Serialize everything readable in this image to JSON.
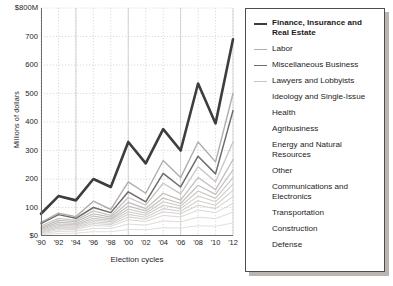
{
  "axes": {
    "ylabel": "Millions of dollars",
    "xlabel": "Election cycles",
    "yticks": [
      "$800M",
      "700",
      "600",
      "500",
      "400",
      "300",
      "200",
      "100",
      "$0"
    ],
    "xticks": [
      "'90",
      "'92",
      "'94",
      "'96",
      "'98",
      "'00",
      "'02",
      "'04",
      "'06",
      "'08",
      "'10",
      "'12"
    ]
  },
  "legend": {
    "items": [
      {
        "label": "Finance, Insurance and Real Estate",
        "color": "#3f3c3c",
        "width": 2.6,
        "bold": true,
        "swatch": true
      },
      {
        "label": "Labor",
        "color": "#b0adab",
        "width": 1.4,
        "bold": false,
        "swatch": true
      },
      {
        "label": "Miscellaneous Business",
        "color": "#6e6b6a",
        "width": 1.5,
        "bold": false,
        "swatch": true
      },
      {
        "label": "Lawyers and Lobbyists",
        "color": "#c8c5c3",
        "width": 1.3,
        "bold": false,
        "swatch": true
      },
      {
        "label": "Ideology and Single-Issue",
        "color": "#bfbcba",
        "width": 1.2,
        "bold": false,
        "swatch": false
      },
      {
        "label": "Health",
        "color": "#c4c1bf",
        "width": 1.2,
        "bold": false,
        "swatch": false
      },
      {
        "label": "Agribusiness",
        "color": "#cac7c5",
        "width": 1.1,
        "bold": false,
        "swatch": false
      },
      {
        "label": "Energy and Natural Resources",
        "color": "#cfccca",
        "width": 1.1,
        "bold": false,
        "swatch": false
      },
      {
        "label": "Other",
        "color": "#d3d0ce",
        "width": 1.1,
        "bold": false,
        "swatch": false
      },
      {
        "label": "Communications and Electronics",
        "color": "#d6d3d1",
        "width": 1.1,
        "bold": false,
        "swatch": false
      },
      {
        "label": "Transportation",
        "color": "#dad7d5",
        "width": 1.0,
        "bold": false,
        "swatch": false
      },
      {
        "label": "Construction",
        "color": "#dedbd9",
        "width": 1.0,
        "bold": false,
        "swatch": false
      },
      {
        "label": "Defense",
        "color": "#e2dfdd",
        "width": 1.0,
        "bold": false,
        "swatch": false
      }
    ]
  },
  "chart_data": {
    "type": "line",
    "title": "",
    "xlabel": "Election cycles",
    "ylabel": "Millions of dollars",
    "x": [
      "'90",
      "'92",
      "'94",
      "'96",
      "'98",
      "'00",
      "'02",
      "'04",
      "'06",
      "'08",
      "'10",
      "'12"
    ],
    "ylim": [
      0,
      800
    ],
    "xlim": [
      "'90",
      "'12"
    ],
    "yticks": [
      0,
      100,
      200,
      300,
      400,
      500,
      600,
      700,
      800
    ],
    "grid": true,
    "legend_position": "right",
    "series": [
      {
        "name": "Finance, Insurance and Real Estate",
        "color": "#3f3c3c",
        "width": 2.6,
        "values": [
          78,
          140,
          125,
          200,
          172,
          330,
          255,
          375,
          300,
          535,
          395,
          690
        ]
      },
      {
        "name": "Labor",
        "color": "#b0adab",
        "width": 1.4,
        "values": [
          48,
          80,
          68,
          122,
          93,
          190,
          150,
          265,
          205,
          330,
          260,
          500
        ]
      },
      {
        "name": "Miscellaneous Business",
        "color": "#6e6b6a",
        "width": 1.5,
        "values": [
          44,
          75,
          62,
          100,
          82,
          155,
          120,
          220,
          172,
          280,
          218,
          440
        ]
      },
      {
        "name": "Lawyers and Lobbyists",
        "color": "#c8c5c3",
        "width": 1.3,
        "values": [
          35,
          62,
          55,
          88,
          72,
          135,
          108,
          185,
          148,
          243,
          190,
          330
        ]
      },
      {
        "name": "Ideology and Single-Issue",
        "color": "#bfbcba",
        "width": 1.2,
        "values": [
          30,
          55,
          50,
          78,
          66,
          118,
          96,
          150,
          126,
          205,
          162,
          268
        ]
      },
      {
        "name": "Health",
        "color": "#c4c1bf",
        "width": 1.2,
        "values": [
          26,
          48,
          44,
          70,
          60,
          105,
          88,
          133,
          114,
          178,
          146,
          232
        ]
      },
      {
        "name": "Agribusiness",
        "color": "#cac7c5",
        "width": 1.1,
        "values": [
          22,
          42,
          39,
          62,
          55,
          95,
          80,
          120,
          105,
          158,
          132,
          205
        ]
      },
      {
        "name": "Energy and Natural Resources",
        "color": "#cfccca",
        "width": 1.1,
        "values": [
          19,
          37,
          35,
          56,
          50,
          85,
          73,
          108,
          96,
          140,
          120,
          182
        ]
      },
      {
        "name": "Other",
        "color": "#d3d0ce",
        "width": 1.1,
        "values": [
          16,
          32,
          31,
          50,
          45,
          76,
          66,
          96,
          87,
          124,
          108,
          160
        ]
      },
      {
        "name": "Communications and Electronics",
        "color": "#d6d3d1",
        "width": 1.1,
        "values": [
          13,
          27,
          27,
          44,
          40,
          67,
          59,
          85,
          78,
          108,
          96,
          138
        ]
      },
      {
        "name": "Transportation",
        "color": "#dad7d5",
        "width": 1.0,
        "values": [
          11,
          22,
          23,
          37,
          34,
          57,
          51,
          72,
          67,
          91,
          82,
          114
        ]
      },
      {
        "name": "Construction",
        "color": "#dedbd9",
        "width": 1.0,
        "values": [
          8,
          16,
          17,
          27,
          26,
          42,
          38,
          53,
          50,
          66,
          61,
          84
        ]
      },
      {
        "name": "Defense",
        "color": "#e2dfdd",
        "width": 1.0,
        "values": [
          5,
          9,
          10,
          15,
          15,
          23,
          22,
          29,
          28,
          36,
          34,
          46
        ]
      }
    ]
  }
}
